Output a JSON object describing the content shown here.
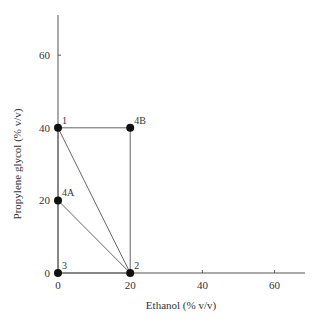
{
  "chart_data": {
    "type": "scatter",
    "title": "",
    "xlabel": "Ethanol (% v/v)",
    "ylabel": "Propylene glycol (% v/v)",
    "xlim": [
      0,
      70
    ],
    "ylim": [
      0,
      72
    ],
    "xticks": [
      0,
      20,
      40,
      60
    ],
    "yticks": [
      0,
      20,
      40,
      60
    ],
    "xtick_labels": [
      "0",
      "20",
      "40",
      "60"
    ],
    "ytick_labels": [
      "0",
      "20",
      "40",
      "60"
    ],
    "grid": false,
    "legend": null,
    "points": [
      {
        "label": "1",
        "x": 0,
        "y": 40
      },
      {
        "label": "2",
        "x": 20,
        "y": 0
      },
      {
        "label": "3",
        "x": 0,
        "y": 0
      },
      {
        "label": "4A",
        "x": 0,
        "y": 20
      },
      {
        "label": "4B",
        "x": 20,
        "y": 40
      }
    ],
    "segments": [
      {
        "from": "1",
        "to": "4B"
      },
      {
        "from": "4B",
        "to": "2"
      },
      {
        "from": "1",
        "to": "2"
      },
      {
        "from": "4A",
        "to": "2"
      },
      {
        "from": "1",
        "to": "3"
      },
      {
        "from": "3",
        "to": "2"
      }
    ]
  }
}
